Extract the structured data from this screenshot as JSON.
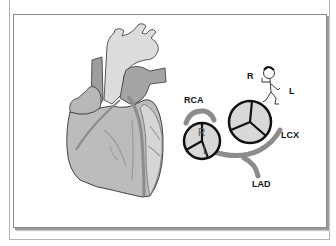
{
  "figure": {
    "type": "anatomical-illustration",
    "labels": {
      "rca": "RCA",
      "lcx": "LCX",
      "lad": "LAD",
      "orientation_right": "R",
      "orientation_left": "L",
      "cusp_right": "R",
      "cusp_left": "L"
    },
    "colors": {
      "heart_fill": "#bdbdbd",
      "vessel_light": "#d9d9d9",
      "vessel_dark": "#9a9a9a",
      "artery": "#8c8c8c",
      "valve_fill": "#d8d8d8",
      "outline": "#111111",
      "frame": "#8a8a8a"
    }
  }
}
